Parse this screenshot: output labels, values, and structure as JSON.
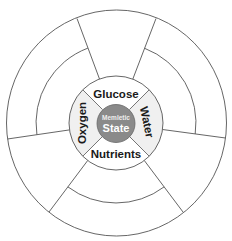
{
  "diagram": {
    "center": {
      "line1": "Memletic",
      "line2": "State"
    },
    "hub_labels": {
      "top": "Glucose",
      "right": "Water",
      "bottom": "Nutrients",
      "left": "Oxygen"
    },
    "outer_segments": 6,
    "colors": {
      "center_fill": "#8a8a8a",
      "side_quadrant_fill": "#f0f0f0",
      "stroke": "#555555",
      "background": "#ffffff"
    }
  }
}
